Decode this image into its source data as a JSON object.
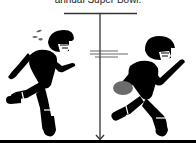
{
  "caption": "annual Super Bowl.",
  "illustration": {
    "left_figure": "player-fleeing-icon",
    "right_figure": "player-carrying-football-icon",
    "divider": "vertical-arrow-divider",
    "colors": {
      "figure": "#000000",
      "football": "#6b6b6b",
      "line": "#333333",
      "background": "#ffffff"
    }
  }
}
